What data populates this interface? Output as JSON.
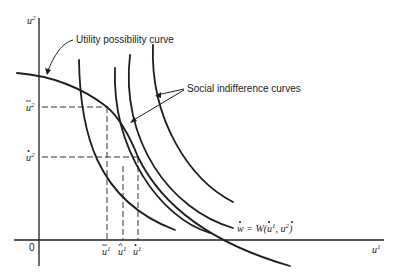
{
  "figure": {
    "type": "economics-diagram",
    "axes": {
      "y_label": "u",
      "y_label_sup": "2",
      "x_label": "u",
      "x_label_sup": "1",
      "origin_label": "0"
    },
    "annotations": {
      "utility_possibility_curve": "Utility possibility curve",
      "social_indifference_curves": "Social indifference curves",
      "welfare_eq_w": "w",
      "welfare_eq_rest": " = W(",
      "welfare_eq_u1": "u",
      "welfare_eq_u1_sup": "1",
      "welfare_eq_comma": ", ",
      "welfare_eq_u2": "u",
      "welfare_eq_u2_sup": "2",
      "welfare_eq_close": ")"
    },
    "y_ticks": [
      {
        "base": "u",
        "accent": "bar",
        "sup": "2",
        "y": 107
      },
      {
        "base": "u",
        "accent": "star",
        "sup": "2",
        "y": 157
      }
    ],
    "x_ticks": [
      {
        "base": "u",
        "accent": "bar",
        "sup": "1",
        "x": 107
      },
      {
        "base": "u",
        "accent": "hat",
        "sup": "1",
        "x": 123
      },
      {
        "base": "u",
        "accent": "star",
        "sup": "1",
        "x": 138
      }
    ],
    "curves": {
      "utility_possibility": "concave frontier, decreasing from u2-axis crossing x-axis",
      "social_indifference_count": 4
    },
    "colors": {
      "ink": "#1e1e1e",
      "background": "#ffffff"
    }
  }
}
